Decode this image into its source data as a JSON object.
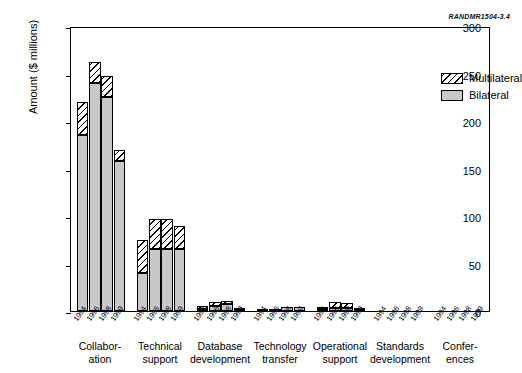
{
  "source_id": "RANDMR1504-3.4",
  "chart_data": {
    "type": "bar",
    "stacked": true,
    "title": "",
    "xlabel": "",
    "ylabel": "Amount ($ millions)",
    "ylim": [
      0,
      300
    ],
    "yticks": [
      0,
      50,
      100,
      150,
      200,
      250,
      300
    ],
    "ytick_labels": [
      "0",
      "50",
      "100",
      "150",
      "200",
      "250",
      "300"
    ],
    "grid": false,
    "legend_position": "top-right",
    "years": [
      "1994",
      "1996",
      "1998",
      "1999"
    ],
    "categories": [
      "Collabor-\nation",
      "Technical\nsupport",
      "Database\ndevelopment",
      "Technology\ntransfer",
      "Operational\nsupport",
      "Standards\ndevelopment",
      "Confer-\nences"
    ],
    "series": [
      {
        "name": "Bilateral",
        "color": "#c8c8c8",
        "values": [
          [
            185,
            240,
            225,
            158
          ],
          [
            40,
            65,
            65,
            65
          ],
          [
            2,
            5,
            7,
            1
          ],
          [
            1,
            1,
            4,
            4
          ],
          [
            2,
            3,
            3,
            1
          ],
          [
            0,
            0,
            0,
            0
          ],
          [
            0,
            0,
            0,
            0
          ]
        ]
      },
      {
        "name": "Multilateral",
        "color": "#ffffff",
        "values": [
          [
            35,
            22,
            22,
            12
          ],
          [
            35,
            32,
            32,
            25
          ],
          [
            3,
            5,
            4,
            1
          ],
          [
            0,
            0,
            0,
            0
          ],
          [
            2,
            6,
            5,
            1
          ],
          [
            0,
            0,
            0,
            0
          ],
          [
            0,
            0,
            0,
            0
          ]
        ]
      }
    ],
    "totals": [
      [
        220,
        262,
        247,
        170
      ],
      [
        75,
        97,
        97,
        90
      ],
      [
        5,
        10,
        11,
        2
      ],
      [
        1,
        1,
        4,
        4
      ],
      [
        4,
        9,
        8,
        2
      ],
      [
        0,
        0,
        0,
        0
      ],
      [
        0,
        0,
        0,
        0
      ]
    ]
  },
  "legend": {
    "entries": [
      {
        "label": "Multilateral"
      },
      {
        "label": "Bilateral"
      }
    ]
  }
}
